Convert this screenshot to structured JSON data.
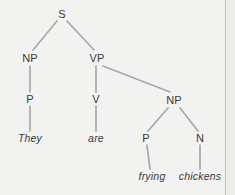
{
  "figure": {
    "sentence": "They are frying chickens",
    "background_color": "#f2f2f0",
    "edge_color": "#a8a8a8",
    "text_color": "#3a3a3a",
    "border_color": "#bdbdbd"
  },
  "nodes": {
    "s": {
      "label": "S",
      "x": 62,
      "y": 14
    },
    "np_subject": {
      "label": "NP",
      "x": 30,
      "y": 58
    },
    "vp": {
      "label": "VP",
      "x": 97,
      "y": 58
    },
    "p_subject": {
      "label": "P",
      "x": 30,
      "y": 99
    },
    "v": {
      "label": "V",
      "x": 96,
      "y": 99
    },
    "np_object": {
      "label": "NP",
      "x": 174,
      "y": 100
    },
    "p_object": {
      "label": "P",
      "x": 146,
      "y": 138
    },
    "n_object": {
      "label": "N",
      "x": 200,
      "y": 138
    }
  },
  "leaves": {
    "they": {
      "label": "They",
      "x": 30,
      "y": 138
    },
    "are": {
      "label": "are",
      "x": 96,
      "y": 138
    },
    "frying": {
      "label": "frying",
      "x": 152,
      "y": 176
    },
    "chickens": {
      "label": "chickens",
      "x": 200,
      "y": 176
    }
  },
  "edges": [
    {
      "name": "edge-s-np",
      "x1": 57,
      "y1": 21,
      "x2": 33,
      "y2": 50
    },
    {
      "name": "edge-s-vp",
      "x1": 67,
      "y1": 21,
      "x2": 94,
      "y2": 50
    },
    {
      "name": "edge-np-p",
      "x1": 30,
      "y1": 66,
      "x2": 30,
      "y2": 92
    },
    {
      "name": "edge-p-they",
      "x1": 30,
      "y1": 106,
      "x2": 30,
      "y2": 131
    },
    {
      "name": "edge-vp-v",
      "x1": 96,
      "y1": 66,
      "x2": 96,
      "y2": 92
    },
    {
      "name": "edge-vp-np",
      "x1": 103,
      "y1": 66,
      "x2": 170,
      "y2": 92
    },
    {
      "name": "edge-v-are",
      "x1": 96,
      "y1": 106,
      "x2": 96,
      "y2": 131
    },
    {
      "name": "edge-np-p2",
      "x1": 168,
      "y1": 108,
      "x2": 148,
      "y2": 131
    },
    {
      "name": "edge-np-n",
      "x1": 180,
      "y1": 108,
      "x2": 198,
      "y2": 131
    },
    {
      "name": "edge-p2-frying",
      "x1": 147,
      "y1": 145,
      "x2": 150,
      "y2": 169
    },
    {
      "name": "edge-n-chickens",
      "x1": 200,
      "y1": 145,
      "x2": 200,
      "y2": 169
    }
  ]
}
